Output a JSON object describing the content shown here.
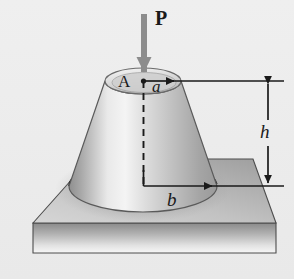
{
  "figure": {
    "domain": "diagram",
    "background_color": "#eeeeee",
    "ink_color": "#1a1a1a",
    "canvas": {
      "width": 294,
      "height": 279
    }
  },
  "labels": {
    "load": "P",
    "apex_point": "A",
    "top_radius": "a",
    "height": "h",
    "bottom_radius": "b"
  },
  "annotations": {
    "load_arrow": {
      "name": "load-arrow-P",
      "color": "#8c8c8c",
      "direction": "down",
      "x": 144,
      "y_start": 14,
      "y_end": 80
    },
    "top_radius_dimension": {
      "name": "radius-a-dimension",
      "from_x": 143,
      "to_x": 178,
      "y": 81,
      "arrow": "right"
    },
    "bottom_radius_dimension": {
      "name": "radius-b-dimension",
      "from_x": 143,
      "to_x": 216,
      "y": 186,
      "arrow": "right"
    },
    "height_dimension": {
      "name": "height-h-dimension",
      "x": 268,
      "y_top": 81,
      "y_bottom": 186,
      "arrow": "both"
    },
    "extension_lines": [
      {
        "name": "upper-extension-line",
        "x1": 178,
        "y1": 81,
        "x2": 284,
        "y2": 81
      },
      {
        "name": "lower-extension-line",
        "x1": 216,
        "y1": 186,
        "x2": 284,
        "y2": 186
      }
    ],
    "center_axis": {
      "name": "vertical-center-axis",
      "x": 143,
      "y_top": 81,
      "y_bottom": 186,
      "style": "dashed"
    },
    "hidden_back_edge": {
      "name": "hidden-base-ellipse-back-edge",
      "style": "dashed"
    }
  },
  "geometry": {
    "frustum": {
      "name": "truncated-cone",
      "top_center": {
        "x": 143,
        "y": 81
      },
      "top_radius_x": 38,
      "top_radius_y": 13,
      "bottom_center": {
        "x": 143,
        "y": 186
      },
      "bottom_radius_x": 74,
      "bottom_radius_y": 26,
      "fill_light": "#f2f2f2",
      "fill_mid": "#c4c4c4",
      "fill_dark": "#a0a0a0",
      "edge_color": "#5a5a5a"
    },
    "base_plate": {
      "name": "base-plate",
      "top_face_points": "33,223 90,159 253,159 276,223",
      "front_face_height": 30,
      "top_fill_light": "#cfcfcf",
      "top_fill_dark": "#9a9a9a",
      "front_fill_top": "#8f8f8f",
      "front_fill_bottom": "#f4f4f4",
      "edge_color": "#4d4d4d"
    }
  }
}
